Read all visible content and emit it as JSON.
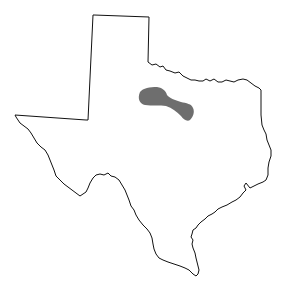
{
  "map": {
    "subject": "Texas",
    "outline_color": "#111111",
    "background_color": "#ffffff",
    "highlighted_region": {
      "label": "shaded range",
      "color": "#666666"
    }
  }
}
